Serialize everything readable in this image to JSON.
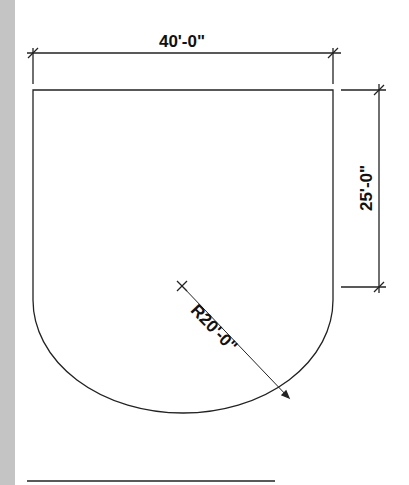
{
  "diagram": {
    "type": "cad-plan-drawing",
    "shape": "rectangle-with-semicircular-end",
    "dimensions": {
      "width": {
        "label": "40'-0\""
      },
      "straight_height": {
        "label": "25'-0\""
      },
      "radius": {
        "label": "R20'-0\""
      }
    },
    "colors": {
      "line": "#222222",
      "background": "#ffffff",
      "side_strip": "#c4c4c4"
    }
  }
}
